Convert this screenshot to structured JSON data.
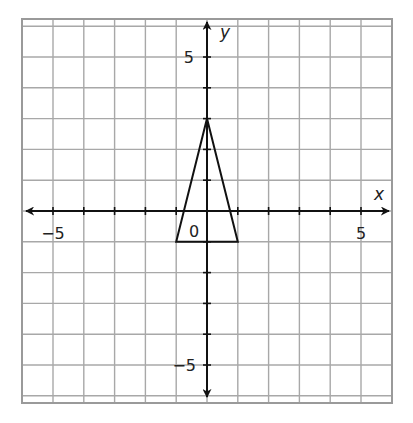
{
  "chart_data": {
    "type": "scatter",
    "title": "",
    "subtitle": "",
    "xlabel": "x",
    "ylabel": "y",
    "xlim": [
      -6,
      6
    ],
    "ylim": [
      -6,
      6
    ],
    "grid": true,
    "grid_step": 1,
    "legend": null,
    "x_tick_labels": [
      {
        "value": -5,
        "label": "−5"
      },
      {
        "value": 5,
        "label": "5"
      }
    ],
    "y_tick_labels": [
      {
        "value": 5,
        "label": "5"
      },
      {
        "value": -5,
        "label": "−5"
      }
    ],
    "origin_label": "0",
    "shapes": [
      {
        "name": "triangle",
        "type": "polygon",
        "vertices": [
          [
            0,
            3
          ],
          [
            -1,
            -1
          ],
          [
            1,
            -1
          ]
        ],
        "filled": false,
        "stroke": "#111111"
      }
    ]
  },
  "style": {
    "grid_color": "#a8a8a8",
    "axis_color": "#111111",
    "border_color": "#9a9a9a",
    "background": "#ffffff"
  }
}
